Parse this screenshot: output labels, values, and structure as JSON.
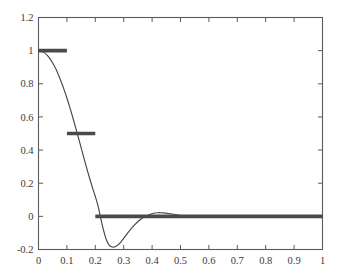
{
  "figure": {
    "background_color": "#ffffff",
    "axes_color": "#5b5b5b",
    "tick_label_color": "#3a3a3a"
  },
  "chart_data": {
    "type": "line",
    "title": "",
    "subtitle": "",
    "xlabel": "",
    "ylabel": "",
    "xlim": [
      0,
      1
    ],
    "ylim": [
      -0.2,
      1.2
    ],
    "grid": false,
    "legend": null,
    "legend_position": "none",
    "box": true,
    "tick_direction": "in",
    "xticks": [
      0,
      0.1,
      0.2,
      0.3,
      0.4,
      0.5,
      0.6,
      0.7,
      0.8,
      0.9,
      1
    ],
    "xticklabels": [
      "0",
      "0.1",
      "0.2",
      "0.3",
      "0.4",
      "0.5",
      "0.6",
      "0.7",
      "0.8",
      "0.9",
      "1"
    ],
    "yticks": [
      -0.2,
      0,
      0.2,
      0.4,
      0.6,
      0.8,
      1,
      1.2
    ],
    "yticklabels": [
      "-0.2",
      "0",
      "0.2",
      "0.4",
      "0.6",
      "0.8",
      "1",
      "1.2"
    ],
    "series": [
      {
        "name": "continuous-response",
        "style": "thin-line",
        "color": "#474747",
        "linewidth": 1.15,
        "x": [
          0.0,
          0.01,
          0.02,
          0.03,
          0.04,
          0.05,
          0.06,
          0.07,
          0.08,
          0.09,
          0.1,
          0.11,
          0.12,
          0.13,
          0.14,
          0.15,
          0.16,
          0.17,
          0.18,
          0.19,
          0.2,
          0.21,
          0.22,
          0.23,
          0.24,
          0.25,
          0.26,
          0.27,
          0.28,
          0.29,
          0.3,
          0.31,
          0.32,
          0.33,
          0.34,
          0.35,
          0.36,
          0.37,
          0.38,
          0.39,
          0.4,
          0.41,
          0.42,
          0.43,
          0.44,
          0.45,
          0.46,
          0.47,
          0.48,
          0.49,
          0.5,
          0.52,
          0.54,
          0.56,
          0.58,
          0.6,
          0.65,
          0.7,
          0.75,
          0.8,
          0.85,
          0.9,
          0.95,
          1.0
        ],
        "y": [
          1.0,
          0.997,
          0.988,
          0.973,
          0.952,
          0.925,
          0.893,
          0.855,
          0.812,
          0.765,
          0.714,
          0.659,
          0.601,
          0.54,
          0.478,
          0.415,
          0.352,
          0.29,
          0.23,
          0.173,
          0.12,
          0.06,
          -0.02,
          -0.09,
          -0.146,
          -0.175,
          -0.185,
          -0.183,
          -0.172,
          -0.155,
          -0.133,
          -0.11,
          -0.088,
          -0.067,
          -0.048,
          -0.031,
          -0.017,
          -0.006,
          0.003,
          0.01,
          0.016,
          0.02,
          0.022,
          0.022,
          0.021,
          0.019,
          0.017,
          0.014,
          0.011,
          0.008,
          0.006,
          0.002,
          -0.001,
          -0.002,
          -0.003,
          -0.003,
          -0.002,
          -0.001,
          0.0,
          0.0,
          0.0,
          0.0,
          0.0,
          0.0
        ]
      },
      {
        "name": "quantized-step",
        "style": "thick-step",
        "color": "#4a4a4a",
        "linewidth": 3.6,
        "steps": [
          {
            "x_start": 0.0,
            "x_end": 0.1,
            "y": 1.0
          },
          {
            "x_start": 0.1,
            "x_end": 0.2,
            "y": 0.5
          },
          {
            "x_start": 0.2,
            "x_end": 1.0,
            "y": 0.0
          }
        ]
      }
    ],
    "annotations": []
  }
}
